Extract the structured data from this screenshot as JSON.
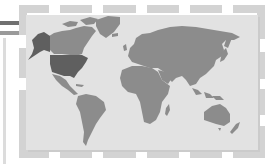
{
  "graphic": {
    "type": "world-map-illustration",
    "highlighted_region": "United States",
    "colors": {
      "background": "#ffffff",
      "frame": "#d3d3d3",
      "panel": "#e2e2e2",
      "panel_shadow": "#cbcbcb",
      "land": "#8c8c8c",
      "highlight": "#5f5f5f",
      "left_bar_dark": "#707070",
      "left_bar_light": "#9a9a9a",
      "left_vertical": "#dcdcdc"
    },
    "frame": {
      "top_segments": [
        [
          19,
          5,
          30,
          8
        ],
        [
          60,
          5,
          32,
          8
        ],
        [
          103,
          5,
          33,
          8
        ],
        [
          147,
          5,
          32,
          8
        ],
        [
          190,
          5,
          32,
          8
        ],
        [
          233,
          5,
          31,
          8
        ]
      ],
      "bottom_segments": [
        [
          19,
          150,
          30,
          8
        ],
        [
          60,
          150,
          32,
          8
        ],
        [
          103,
          150,
          33,
          8
        ],
        [
          147,
          150,
          32,
          8
        ],
        [
          190,
          150,
          32,
          8
        ],
        [
          233,
          150,
          31,
          8
        ]
      ],
      "left_segments": [
        [
          19,
          5,
          8,
          30
        ],
        [
          19,
          48,
          8,
          30
        ],
        [
          19,
          90,
          8,
          68
        ]
      ],
      "right_segments": [
        [
          257,
          5,
          8,
          34
        ],
        [
          257,
          52,
          8,
          27
        ],
        [
          257,
          89,
          8,
          26
        ],
        [
          257,
          126,
          8,
          32
        ]
      ]
    }
  }
}
